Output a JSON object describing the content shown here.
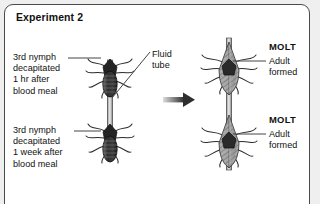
{
  "panel": {
    "title": "Experiment 2",
    "border_color": "#4a4a4a",
    "background": "#ffffff",
    "page_background": "#efefef"
  },
  "labels": {
    "left_top": "3rd nymph\ndecapitated\n1 hr after\nblood meal",
    "left_bottom": "3rd nymph\ndecapitated\n1 week after\nblood meal",
    "fluid_tube": "Fluid\ntube",
    "molt_top": "MOLT",
    "molt_bottom": "MOLT",
    "adult_top": "Adult\nformed",
    "adult_bottom": "Adult\nformed"
  },
  "figures": {
    "left": {
      "name": "parabiosed-nymph-pair",
      "description": "two dark decapitated 3rd-instar nymphs joined vertically by a fluid tube",
      "body_color": "#3f3f3f",
      "count": 2
    },
    "right": {
      "name": "parabiosed-adult-pair",
      "description": "two winged adults joined vertically by a fluid tube after molting",
      "body_color": "#9a9a9a",
      "count": 2
    },
    "arrow": {
      "name": "transition-arrow",
      "direction": "right",
      "color": "#333333"
    },
    "fluid_tube_color": "#8a8a8a",
    "leader_line_color": "#555555"
  }
}
